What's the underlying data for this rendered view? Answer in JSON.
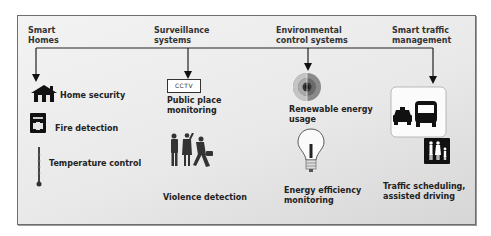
{
  "categories": [
    {
      "id": "smart-homes",
      "label_line1": "Smart",
      "label_line2": "Homes"
    },
    {
      "id": "surveillance",
      "label_line1": "Surveillance",
      "label_line2": "systems"
    },
    {
      "id": "environmental",
      "label_line1": "Environmental",
      "label_line2": "control systems"
    },
    {
      "id": "traffic",
      "label_line1": "Smart traffic",
      "label_line2": "management"
    }
  ],
  "smart_homes": {
    "items": [
      {
        "label": "Home security",
        "icon": "house-icon"
      },
      {
        "label": "Fire detection",
        "icon": "fire-alarm-icon"
      },
      {
        "label": "Temperature control",
        "icon": "thermometer-icon"
      }
    ]
  },
  "surveillance": {
    "cctv_label": "CCTV",
    "items": [
      {
        "label_line1": "Public place",
        "label_line2": "monitoring",
        "icon": "cctv-icon"
      },
      {
        "label": "Violence detection",
        "icon": "people-fighting-icon"
      }
    ]
  },
  "environmental": {
    "items": [
      {
        "label_line1": "Renewable energy",
        "label_line2": "usage",
        "icon": "earth-core-icon"
      },
      {
        "label_line1": "Energy efficiency",
        "label_line2": "monitoring",
        "icon": "light-bulb-icon"
      }
    ]
  },
  "traffic": {
    "items": [
      {
        "label_line1": "Traffic scheduling,",
        "label_line2": "assisted driving",
        "icon": "taxi-bus-pedestrians-icon"
      }
    ]
  },
  "colors": {
    "frame_border": "#6e6e6e",
    "background_light": "#f3f3f3",
    "background_dark": "#d6d6d6",
    "text": "#222222",
    "icon": "#1a1a1a"
  }
}
